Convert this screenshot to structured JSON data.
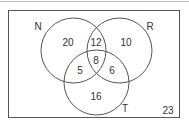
{
  "diagram": {
    "type": "venn-3-set",
    "sets": [
      {
        "label": "N",
        "cx": 73.5,
        "cy": 50.5,
        "r": 32.5,
        "label_x": 38,
        "label_y": 30
      },
      {
        "label": "R",
        "cx": 119.5,
        "cy": 50.5,
        "r": 32.5,
        "label_x": 150,
        "label_y": 30
      },
      {
        "label": "T",
        "cx": 96.5,
        "cy": 82.5,
        "r": 32.5,
        "label_x": 125,
        "label_y": 112
      }
    ],
    "regions": [
      {
        "name": "N-only",
        "value": "20",
        "x": 68,
        "y": 46
      },
      {
        "name": "N-and-R-only",
        "value": "12",
        "x": 96,
        "y": 46
      },
      {
        "name": "R-only",
        "value": "10",
        "x": 126,
        "y": 46
      },
      {
        "name": "N-R-T",
        "value": "8",
        "x": 96,
        "y": 64
      },
      {
        "name": "N-and-T-only",
        "value": "5",
        "x": 80,
        "y": 74
      },
      {
        "name": "R-and-T-only",
        "value": "6",
        "x": 112,
        "y": 74
      },
      {
        "name": "T-only",
        "value": "16",
        "x": 96,
        "y": 100
      },
      {
        "name": "outside",
        "value": "23",
        "x": 168,
        "y": 114
      }
    ],
    "universe": {
      "x": 8.5,
      "y": 10.5,
      "width": 171,
      "height": 107
    },
    "stroke_color": "#555555"
  }
}
